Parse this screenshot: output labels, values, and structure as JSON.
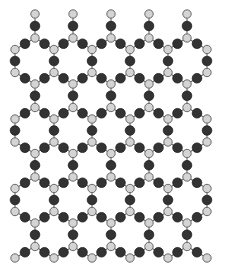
{
  "figure": {
    "caption": "",
    "type": "hexagonal 2D framework lattice (ball-and-stick)",
    "colors": {
      "background": "#ffffff",
      "bond": "#6a6a6a",
      "light_atom_fill": "#d4d4d4",
      "light_atom_stroke": "#5a5a5a",
      "dark_atom_fill": "#333333",
      "dark_atom_stroke": "#1e1e1e"
    },
    "atoms": {
      "light_radius": 4.2,
      "dark_radius": 4.8
    },
    "lattice": {
      "junction_columns_x": [
        35,
        73,
        111,
        149,
        187
      ],
      "edge_columns_x": [
        15,
        54,
        92,
        130,
        168,
        207
      ],
      "row_origins_y": [
        38,
        107.5,
        177,
        246.5
      ],
      "row_period_y": 69.5,
      "zigzag_drop": 11.5,
      "vertical_link_length": 23,
      "top_cap": {
        "light_y": 14,
        "dark_y": 26
      },
      "bottom_edge_light_y": 258
    }
  }
}
